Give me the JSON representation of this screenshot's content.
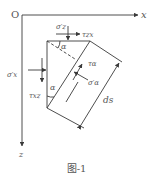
{
  "figure": {
    "caption": "图-1",
    "line_color": "#3a3a3a",
    "text_color": "#555555"
  },
  "axes": {
    "origin_label": "O",
    "x_label": "x",
    "z_label": "z"
  },
  "labels": {
    "sigma_z_prime_top": "σ′z",
    "tau_zx_top": "τzx",
    "alpha_top": "α",
    "tau_alpha": "τα",
    "sigma_alpha_prime": "σ′α",
    "sigma_x_prime_left": "σ′x",
    "tau_xz_left": "τxz",
    "alpha_left": "α",
    "ds": "ds"
  }
}
